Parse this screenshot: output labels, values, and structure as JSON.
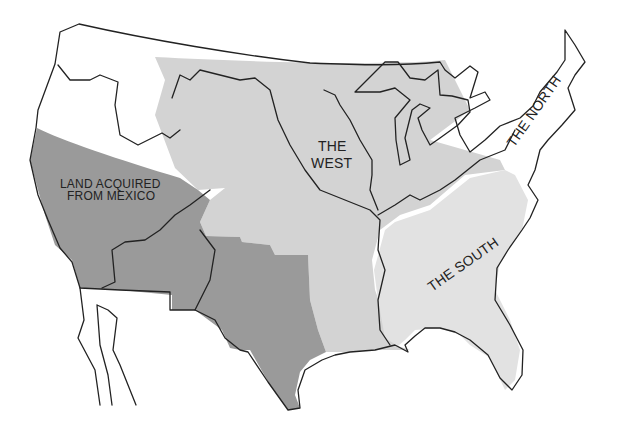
{
  "map": {
    "type": "historical-region-map",
    "subject": "United States sectional regions",
    "colors": {
      "background": "#ffffff",
      "mexico_cession": "#9a9a9a",
      "west": "#d3d3d3",
      "south": "#e2e2e2",
      "north": "#ffffff",
      "unshaded": "#ffffff",
      "outline": "#222222"
    },
    "regions": [
      {
        "id": "north",
        "label": "THE NORTH"
      },
      {
        "id": "west",
        "label_line1": "THE",
        "label_line2": "WEST"
      },
      {
        "id": "south",
        "label": "THE SOUTH"
      },
      {
        "id": "mexico",
        "label_line1": "LAND ACQUIRED",
        "label_line2": "FROM MEXICO"
      }
    ]
  }
}
